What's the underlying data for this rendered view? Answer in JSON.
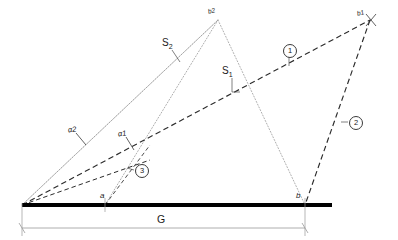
{
  "diagram": {
    "colors": {
      "baseline": "#000000",
      "dashed_line": "#2b2b2b",
      "dotted_line": "#9a9a9a",
      "solid_thin": "#7a7a7a",
      "dimension_line": "#9a9a9a",
      "text": "#1a1a1a",
      "background": "#ffffff"
    },
    "labels": {
      "s2": "S",
      "s2_sub": "2",
      "s1": "S",
      "s1_sub": "1",
      "alpha2": "α2",
      "alpha1": "α1",
      "point_a": "a",
      "point_b": "b",
      "apex_b2": "b2",
      "apex_b1": "b1",
      "baseline_g": "G",
      "marker_1": "1",
      "marker_2": "2",
      "marker_3": "3"
    },
    "geometry": {
      "origin": {
        "x": 22,
        "y": 205
      },
      "point_a": {
        "x": 105,
        "y": 205
      },
      "point_b": {
        "x": 305,
        "y": 205
      },
      "baseline_end": {
        "x": 332,
        "y": 205
      },
      "apex_b2": {
        "x": 218,
        "y": 20
      },
      "apex_b1": {
        "x": 370,
        "y": 20
      },
      "dimension_y": 228,
      "baseline_thickness": 4
    }
  }
}
